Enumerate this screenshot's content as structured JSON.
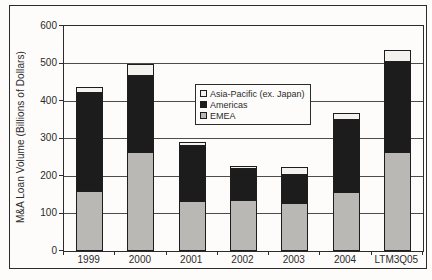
{
  "palette": {
    "frame_border": "#2b2b2b",
    "gridline": "#4c4c4c",
    "text": "#2b2b2b",
    "background": "#fdfcfa"
  },
  "chart_data": {
    "type": "bar",
    "stacked": true,
    "title": "",
    "categories": [
      "1999",
      "2000",
      "2001",
      "2002",
      "2003",
      "2004",
      "LTM3Q05"
    ],
    "series": [
      {
        "name": "EMEA",
        "color": "#b9b8b4",
        "values": [
          160,
          265,
          134,
          135,
          127,
          158,
          265
        ]
      },
      {
        "name": "Americas",
        "color": "#1c1c1c",
        "values": [
          262,
          203,
          146,
          83,
          76,
          192,
          240
        ]
      },
      {
        "name": "Asia-Pacific (ex. Japan)",
        "color": "#f4f2ee",
        "values": [
          15,
          30,
          10,
          9,
          22,
          17,
          30
        ]
      }
    ],
    "stack_totals": [
      437,
      498,
      290,
      227,
      225,
      367,
      535
    ],
    "ylabel": "M&A Loan Volume (Billions of Dollars)",
    "xlabel": "",
    "ylim": [
      0,
      600
    ],
    "y_ticks": [
      0,
      100,
      200,
      300,
      400,
      500,
      600
    ],
    "grid": true,
    "legend": {
      "position": "inside-upper-center",
      "entries_top_to_bottom": [
        "Asia-Pacific (ex. Japan)",
        "Americas",
        "EMEA"
      ]
    }
  }
}
